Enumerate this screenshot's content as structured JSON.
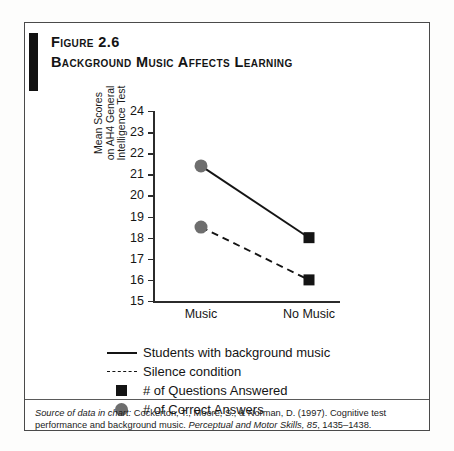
{
  "figure": {
    "number": "Figure 2.6",
    "title": "Background Music  Affects Learning"
  },
  "chart_data": {
    "type": "line",
    "title": "Background Music Affects Learning",
    "xlabel": "",
    "ylabel": "Mean Scores on AH4 General Intelligence Test",
    "ylabel_lines": [
      "Mean Scores",
      "on AH4 General",
      "Intelligence Test"
    ],
    "categories": [
      "Music",
      "No Music"
    ],
    "ylim": [
      15,
      24
    ],
    "yticks": [
      15,
      16,
      17,
      18,
      19,
      20,
      21,
      22,
      23,
      24
    ],
    "ytick_labels": [
      "15",
      "16",
      "17",
      "18",
      "19",
      "20",
      "21",
      "22",
      "23",
      "24"
    ],
    "grid": false,
    "legend_position": "below",
    "series": [
      {
        "name": "Students with background music",
        "line": "solid",
        "values": [
          21.4,
          18.0
        ],
        "markers": [
          "circle",
          "square"
        ]
      },
      {
        "name": "Silence condition",
        "line": "dashed",
        "values": [
          18.5,
          16.0
        ],
        "markers": [
          "circle",
          "square"
        ]
      }
    ],
    "marker_legend": [
      {
        "marker": "square",
        "label": "# of Questions Answered",
        "color": "#141414"
      },
      {
        "marker": "circle",
        "label": "# of Correct Answers",
        "color": "#6e6e6e"
      }
    ]
  },
  "legend": [
    {
      "marker": "solid-line",
      "label": "Students with background music"
    },
    {
      "marker": "dashed-line",
      "label": "Silence condition"
    },
    {
      "marker": "black-square",
      "label": "# of Questions Answered"
    },
    {
      "marker": "gray-circle",
      "label": "# of Correct Answers"
    }
  ],
  "source": {
    "prefix": "Source of data in chart:",
    "body_1": " Cockerton, T., Moore, S., & Norman, D. (1997). Cognitive test performance and background music. ",
    "journal": "Perceptual and Motor Skills, 85",
    "body_2": ", 1435–1438."
  },
  "colors": {
    "line": "#141414",
    "circle": "#6e6e6e",
    "square": "#141414",
    "axis": "#2b2b2b",
    "border": "#4a4a4a",
    "accent": "#111111"
  }
}
